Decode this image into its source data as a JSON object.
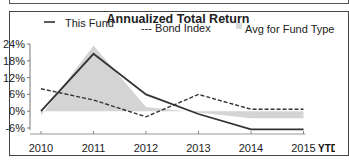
{
  "chart_data": {
    "type": "line",
    "title": "Annualized Total Return",
    "xlabel": "",
    "ylabel": "",
    "categories": [
      "2010",
      "2011",
      "2012",
      "2013",
      "2014",
      "2015"
    ],
    "x_suffix_label": "YTD",
    "y_ticks": [
      "24%",
      "18%",
      "12%",
      "6%",
      "0%",
      "-6%"
    ],
    "y_tick_values": [
      24,
      18,
      12,
      6,
      0,
      -6
    ],
    "ylim": [
      -6,
      24
    ],
    "grid": false,
    "legend_position": "top",
    "series": [
      {
        "name": "This Fund",
        "legend_label": "This Fund",
        "style": "solid",
        "color": "#333333",
        "values": [
          0,
          20.5,
          6,
          -1,
          -6.5,
          -6.5
        ]
      },
      {
        "name": "Bond Index",
        "legend_label": "--- Bond Index",
        "style": "dashed",
        "color": "#333333",
        "values": [
          8,
          4,
          -2,
          6,
          0.7,
          0.7
        ]
      },
      {
        "name": "Avg for Fund Type",
        "legend_label": "Avg for Fund Type",
        "style": "area",
        "color": "#d4d4d4",
        "values": [
          -1.5,
          23.5,
          1.5,
          -0.5,
          -2.5,
          -2.5
        ]
      }
    ]
  }
}
